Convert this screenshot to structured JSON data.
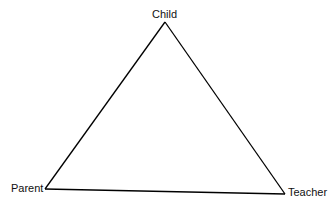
{
  "diagram": {
    "type": "triangle",
    "nodes": [
      {
        "id": "child",
        "label": "Child",
        "position": "top"
      },
      {
        "id": "parent",
        "label": "Parent",
        "position": "bottom-left"
      },
      {
        "id": "teacher",
        "label": "Teacher",
        "position": "bottom-right"
      }
    ],
    "edges": [
      {
        "from": "child",
        "to": "parent"
      },
      {
        "from": "child",
        "to": "teacher"
      },
      {
        "from": "parent",
        "to": "teacher"
      }
    ],
    "line_color": "#000000"
  }
}
